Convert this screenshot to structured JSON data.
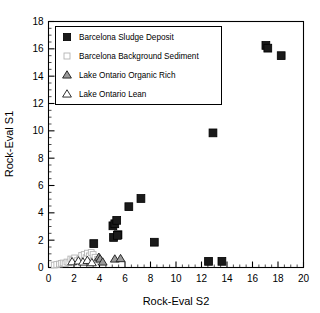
{
  "chart_data": {
    "type": "scatter",
    "title": "",
    "xlabel": "Rock-Eval S2",
    "ylabel": "Rock-Eval S1",
    "xlim": [
      0,
      20
    ],
    "ylim": [
      0,
      18
    ],
    "xticks": [
      0,
      2,
      4,
      6,
      8,
      10,
      12,
      14,
      16,
      18,
      20
    ],
    "yticks": [
      0,
      2,
      4,
      6,
      8,
      10,
      12,
      14,
      16,
      18
    ],
    "xtick_labels": [
      "0",
      "2",
      "4",
      "6",
      "8",
      "10",
      "12",
      "14",
      "16",
      "18",
      "20"
    ],
    "ytick_labels": [
      "0",
      "2",
      "4",
      "6",
      "8",
      "10",
      "12",
      "14",
      "16",
      "18"
    ],
    "x_minor_ticks": true,
    "y_minor_ticks": true,
    "grid": false,
    "legend_position": "top-left",
    "series": [
      {
        "name": "Barcelona Sludge Deposit",
        "marker": "filled-square",
        "color": "#1a1a1a",
        "edge": "#000000",
        "points": [
          [
            3.55,
            1.75
          ],
          [
            5.1,
            2.2
          ],
          [
            5.45,
            2.4
          ],
          [
            5.4,
            2.35
          ],
          [
            5.05,
            3.05
          ],
          [
            5.2,
            3.2
          ],
          [
            5.35,
            3.45
          ],
          [
            6.3,
            4.45
          ],
          [
            7.25,
            5.05
          ],
          [
            8.3,
            1.85
          ],
          [
            12.55,
            0.45
          ],
          [
            13.6,
            0.45
          ],
          [
            12.9,
            9.85
          ],
          [
            17.05,
            16.25
          ],
          [
            17.2,
            16.05
          ],
          [
            18.25,
            15.5
          ]
        ]
      },
      {
        "name": "Barcelona Background Sediment",
        "marker": "open-square",
        "color": "#ffffff",
        "edge": "#b4b4b4",
        "points": [
          [
            0.45,
            0.18
          ],
          [
            0.65,
            0.22
          ],
          [
            0.85,
            0.25
          ],
          [
            1.0,
            0.3
          ],
          [
            1.15,
            0.33
          ],
          [
            1.3,
            0.28
          ],
          [
            1.45,
            0.4
          ],
          [
            1.6,
            0.35
          ],
          [
            1.75,
            0.62
          ],
          [
            1.9,
            0.55
          ],
          [
            2.05,
            0.7
          ],
          [
            2.25,
            0.5
          ],
          [
            2.45,
            0.62
          ],
          [
            2.6,
            0.88
          ],
          [
            2.8,
            0.95
          ],
          [
            2.95,
            0.72
          ],
          [
            3.05,
            1.05
          ],
          [
            3.2,
            0.85
          ],
          [
            3.35,
            1.1
          ],
          [
            3.5,
            0.95
          ],
          [
            3.65,
            0.75
          ],
          [
            3.85,
            0.6
          ],
          [
            4.05,
            0.45
          ]
        ]
      },
      {
        "name": "Lake Ontario Organic Rich",
        "marker": "filled-triangle",
        "color": "#9a9a9a",
        "edge": "#1a1a1a",
        "points": [
          [
            3.95,
            0.75
          ],
          [
            4.05,
            0.62
          ],
          [
            5.2,
            0.62
          ],
          [
            5.65,
            0.65
          ],
          [
            4.25,
            0.4
          ]
        ]
      },
      {
        "name": "Lake Ontario Lean",
        "marker": "open-triangle",
        "color": "#ffffff",
        "edge": "#1a1a1a",
        "points": [
          [
            1.85,
            0.42
          ],
          [
            2.35,
            0.48
          ],
          [
            2.7,
            0.4
          ],
          [
            3.05,
            0.52
          ],
          [
            3.4,
            0.35
          ]
        ]
      }
    ]
  },
  "legend": {
    "items": [
      {
        "label": "Barcelona Sludge Deposit",
        "marker": "filled-square"
      },
      {
        "label": "Barcelona Background Sediment",
        "marker": "open-square"
      },
      {
        "label": "Lake Ontario Organic Rich",
        "marker": "filled-triangle"
      },
      {
        "label": "Lake Ontario Lean",
        "marker": "open-triangle"
      }
    ]
  },
  "axes": {
    "x_title": "Rock-Eval S2",
    "y_title": "Rock-Eval S1"
  }
}
